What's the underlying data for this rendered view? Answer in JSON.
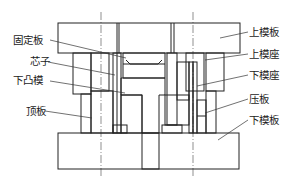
{
  "diagram": {
    "type": "mold cross-section",
    "colors": {
      "line": "#222222",
      "background": "#ffffff"
    },
    "labels_left": [
      {
        "text": "固定板",
        "x": 13,
        "y": 44
      },
      {
        "text": "芯子",
        "x": 30,
        "y": 65
      },
      {
        "text": "下凸模",
        "x": 13,
        "y": 84
      },
      {
        "text": "顶板",
        "x": 26,
        "y": 115
      }
    ],
    "labels_right": [
      {
        "text": "上模板",
        "x": 249,
        "y": 36
      },
      {
        "text": "上模座",
        "x": 249,
        "y": 58
      },
      {
        "text": "下模座",
        "x": 249,
        "y": 79
      },
      {
        "text": "压板",
        "x": 249,
        "y": 103
      },
      {
        "text": "下模板",
        "x": 249,
        "y": 124
      }
    ]
  }
}
